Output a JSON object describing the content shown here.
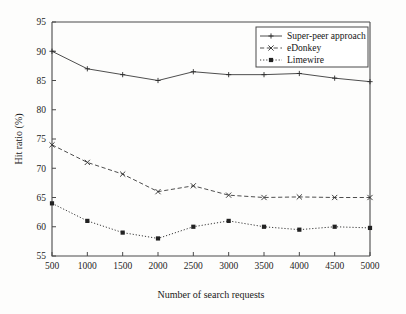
{
  "chart_data": {
    "type": "line",
    "title": "",
    "xlabel": "Number of search requests",
    "ylabel": "Hit ratio (%)",
    "x": [
      500,
      1000,
      1500,
      2000,
      2500,
      3000,
      3500,
      4000,
      4500,
      5000
    ],
    "xticklabels": [
      "500",
      "1000",
      "1500",
      "2000",
      "2500",
      "3000",
      "3500",
      "4000",
      "4500",
      "5000"
    ],
    "yticklabels": [
      "55",
      "60",
      "65",
      "70",
      "75",
      "80",
      "85",
      "90",
      "95"
    ],
    "yticks": [
      55,
      60,
      65,
      70,
      75,
      80,
      85,
      90,
      95
    ],
    "xlim": [
      500,
      5000
    ],
    "ylim": [
      55,
      95
    ],
    "grid": false,
    "legend_position": "top-right",
    "series": [
      {
        "name": "Super-peer approach",
        "marker": "plus",
        "linestyle": "solid",
        "color": "#3a3a3a",
        "values": [
          90,
          87,
          86,
          85,
          86.5,
          86,
          86,
          86.2,
          85.4,
          84.8
        ]
      },
      {
        "name": "eDonkey",
        "marker": "cross",
        "linestyle": "dashed",
        "color": "#3a3a3a",
        "values": [
          74,
          71,
          69,
          66,
          67,
          65.4,
          65,
          65.1,
          65,
          65
        ]
      },
      {
        "name": "Limewire",
        "marker": "square",
        "linestyle": "dotted",
        "color": "#3a3a3a",
        "values": [
          64,
          61,
          59,
          58,
          60,
          61,
          60,
          59.5,
          60,
          59.8
        ]
      }
    ]
  },
  "legend": {
    "entries": [
      {
        "label": "Super-peer approach"
      },
      {
        "label": "eDonkey"
      },
      {
        "label": "Limewire"
      }
    ]
  }
}
